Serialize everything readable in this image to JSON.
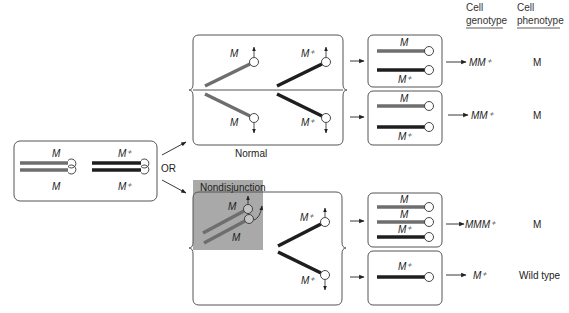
{
  "colors": {
    "mutant_chromosome": "#6e6e6e",
    "wildtype_chromosome": "#1e1e1e",
    "shade": "#a9a9a9",
    "border": "#555555"
  },
  "headers": {
    "genotype_line1": "Cell",
    "genotype_line2": "genotype",
    "phenotype_line1": "Cell",
    "phenotype_line2": "phenotype"
  },
  "parent": {
    "mutant_top": "M",
    "mutant_bottom": "M",
    "wild_top": "M⁺",
    "wild_bottom": "M⁺",
    "or_label": "OR"
  },
  "normal": {
    "label": "Normal",
    "upper_mutant": "M",
    "lower_mutant": "M",
    "upper_wild": "M⁺",
    "lower_wild": "M⁺"
  },
  "nondisjunction": {
    "label": "Nondisjunction",
    "mutant_a": "M",
    "mutant_b": "M",
    "upper_wild": "M⁺",
    "lower_wild": "M⁺"
  },
  "results": [
    {
      "chromosomes": [
        "M",
        "M⁺"
      ],
      "genotype": "MM⁺",
      "phenotype": "M"
    },
    {
      "chromosomes": [
        "M",
        "M⁺"
      ],
      "genotype": "MM⁺",
      "phenotype": "M"
    },
    {
      "chromosomes": [
        "M",
        "M",
        "M⁺"
      ],
      "genotype": "MMM⁺",
      "phenotype": "M"
    },
    {
      "chromosomes": [
        "M⁺"
      ],
      "genotype": "M⁺",
      "phenotype": "Wild type"
    }
  ]
}
